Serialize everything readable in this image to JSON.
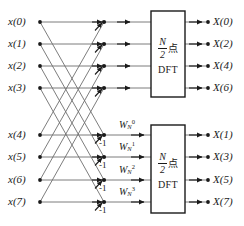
{
  "diagram": {
    "line_color": "#6e6e6e",
    "dark_color": "#1a1a1a",
    "background": "#ffffff"
  },
  "inputs": [
    {
      "label": "x(0)",
      "y": 22
    },
    {
      "label": "x(1)",
      "y": 44
    },
    {
      "label": "x(2)",
      "y": 66
    },
    {
      "label": "x(3)",
      "y": 88
    },
    {
      "label": "x(4)",
      "y": 135
    },
    {
      "label": "x(5)",
      "y": 157
    },
    {
      "label": "x(6)",
      "y": 180
    },
    {
      "label": "x(7)",
      "y": 202
    }
  ],
  "outputs": [
    {
      "label": "X(0)",
      "y": 22
    },
    {
      "label": "X(2)",
      "y": 44
    },
    {
      "label": "X(4)",
      "y": 66
    },
    {
      "label": "X(6)",
      "y": 88
    },
    {
      "label": "X(1)",
      "y": 135
    },
    {
      "label": "X(3)",
      "y": 157
    },
    {
      "label": "X(5)",
      "y": 180
    },
    {
      "label": "X(7)",
      "y": 202
    }
  ],
  "negative_labels": [
    {
      "text": "-1",
      "y": 135
    },
    {
      "text": "-1",
      "y": 157
    },
    {
      "text": "-1",
      "y": 180
    },
    {
      "text": "-1",
      "y": 202
    }
  ],
  "twiddles": [
    {
      "base": "W",
      "sub": "N",
      "sup": "0",
      "y": 135
    },
    {
      "base": "W",
      "sub": "N",
      "sup": "1",
      "y": 157
    },
    {
      "base": "W",
      "sub": "N",
      "sup": "2",
      "y": 180
    },
    {
      "base": "W",
      "sub": "N",
      "sup": "3",
      "y": 202
    }
  ],
  "blocks": [
    {
      "id": "dft-upper",
      "numerator": "N",
      "denominator": "2",
      "unit": "点",
      "name": "DFT",
      "x": 151,
      "y": 11,
      "w": 34,
      "h": 86
    },
    {
      "id": "dft-lower",
      "numerator": "N",
      "denominator": "2",
      "unit": "点",
      "name": "DFT",
      "x": 151,
      "y": 125,
      "w": 34,
      "h": 88
    }
  ]
}
